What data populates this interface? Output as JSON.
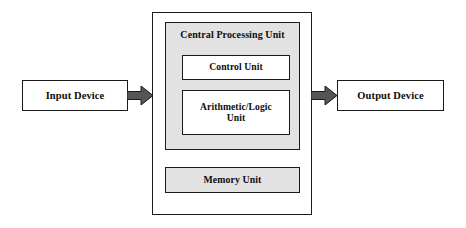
{
  "diagram": {
    "colors": {
      "shaded_fill": "#e2e2e2",
      "box_fill": "#ffffff",
      "stroke": "#1a1a1a",
      "arrow_fill": "#555555",
      "arrow_stroke": "#1a1a1a",
      "text": "#0d0d0d"
    },
    "nodes": {
      "input_device": {
        "label": "Input Device"
      },
      "output_device": {
        "label": "Output Device"
      },
      "system_unit": {
        "label": ""
      },
      "cpu": {
        "label": "Central Processing Unit"
      },
      "control_unit": {
        "label": "Control Unit"
      },
      "alu": {
        "label_line1": "Arithmetic/Logic",
        "label_line2": "Unit"
      },
      "memory_unit": {
        "label": "Memory Unit"
      }
    },
    "arrows": [
      {
        "name": "input-to-cpu",
        "from": "Input Device",
        "to": "Central Processing Unit",
        "direction": "right"
      },
      {
        "name": "cpu-to-output",
        "from": "Central Processing Unit",
        "to": "Output Device",
        "direction": "right"
      }
    ]
  }
}
